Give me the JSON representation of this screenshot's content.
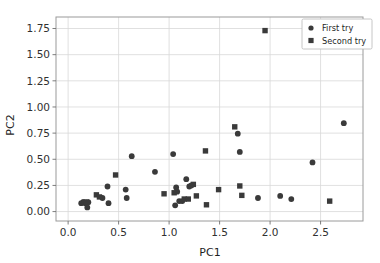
{
  "figure": {
    "background_color": "#ffffff",
    "marker_color": "#3a3a3a",
    "grid_color": "#d8d8d8",
    "spine_color": "#9a9a9a"
  },
  "axes": {
    "xlabel": "PC1",
    "ylabel": "PC2",
    "x_ticks": [
      "0.0",
      "0.5",
      "1.0",
      "1.5",
      "2.0",
      "2.5"
    ],
    "y_ticks": [
      "0.00",
      "0.25",
      "0.50",
      "0.75",
      "1.00",
      "1.25",
      "1.50",
      "1.75"
    ]
  },
  "legend": {
    "entries": [
      {
        "label": "First try",
        "marker": "circle"
      },
      {
        "label": "Second try",
        "marker": "square"
      }
    ]
  },
  "chart_data": {
    "type": "scatter",
    "title": "",
    "xlabel": "PC1",
    "ylabel": "PC2",
    "xlim": [
      -0.12,
      2.92
    ],
    "ylim": [
      -0.09,
      1.86
    ],
    "grid": true,
    "legend_position": "upper right",
    "x_ticks": [
      0.0,
      0.5,
      1.0,
      1.5,
      2.0,
      2.5
    ],
    "y_ticks": [
      0.0,
      0.25,
      0.5,
      0.75,
      1.0,
      1.25,
      1.5,
      1.75
    ],
    "series": [
      {
        "name": "First try",
        "marker": "circle",
        "color": "#3a3a3a",
        "points": [
          [
            0.13,
            0.08
          ],
          [
            0.15,
            0.09
          ],
          [
            0.17,
            0.08
          ],
          [
            0.19,
            0.04
          ],
          [
            0.2,
            0.09
          ],
          [
            0.34,
            0.13
          ],
          [
            0.39,
            0.24
          ],
          [
            0.4,
            0.08
          ],
          [
            0.57,
            0.21
          ],
          [
            0.58,
            0.13
          ],
          [
            0.63,
            0.53
          ],
          [
            0.86,
            0.38
          ],
          [
            1.04,
            0.55
          ],
          [
            1.06,
            0.06
          ],
          [
            1.07,
            0.23
          ],
          [
            1.08,
            0.19
          ],
          [
            1.1,
            0.1
          ],
          [
            1.13,
            0.1
          ],
          [
            1.17,
            0.31
          ],
          [
            1.2,
            0.24
          ],
          [
            1.22,
            0.25
          ],
          [
            1.68,
            0.745
          ],
          [
            1.7,
            0.57
          ],
          [
            1.88,
            0.13
          ],
          [
            2.1,
            0.15
          ],
          [
            2.21,
            0.12
          ],
          [
            2.42,
            0.47
          ],
          [
            2.73,
            0.845
          ]
        ]
      },
      {
        "name": "Second try",
        "marker": "square",
        "color": "#3a3a3a",
        "points": [
          [
            0.16,
            0.09
          ],
          [
            0.18,
            0.09
          ],
          [
            0.28,
            0.16
          ],
          [
            0.31,
            0.14
          ],
          [
            0.47,
            0.35
          ],
          [
            0.95,
            0.17
          ],
          [
            1.05,
            0.18
          ],
          [
            1.15,
            0.12
          ],
          [
            1.19,
            0.12
          ],
          [
            1.24,
            0.26
          ],
          [
            1.27,
            0.15
          ],
          [
            1.36,
            0.58
          ],
          [
            1.37,
            0.065
          ],
          [
            1.49,
            0.21
          ],
          [
            1.65,
            0.81
          ],
          [
            1.7,
            0.245
          ],
          [
            1.72,
            0.155
          ],
          [
            1.95,
            1.73
          ],
          [
            2.59,
            0.1
          ]
        ]
      }
    ]
  }
}
